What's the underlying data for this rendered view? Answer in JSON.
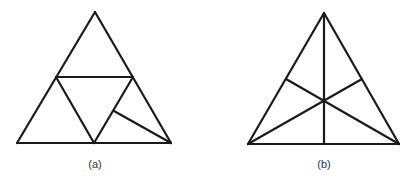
{
  "colors": {
    "stroke": "#1a1a1a",
    "label": "#333333",
    "background": "#ffffff"
  },
  "figures": [
    {
      "label": "(a)",
      "label_pos": [
        95,
        158
      ],
      "description": "Triangle subdivided into four triangles by midpoints, with an extra segment from an interior point to the bottom-right vertex",
      "segments": [
        [
          95,
          12,
          17,
          143
        ],
        [
          95,
          12,
          171,
          143
        ],
        [
          17,
          143,
          171,
          143
        ],
        [
          56,
          77,
          133,
          77
        ],
        [
          56,
          77,
          94,
          143
        ],
        [
          133,
          77,
          94,
          143
        ],
        [
          114,
          111,
          171,
          143
        ]
      ]
    },
    {
      "label": "(b)",
      "label_pos": [
        324,
        158
      ],
      "description": "Triangle with its three medians meeting at the centroid",
      "segments": [
        [
          324,
          13,
          248,
          144
        ],
        [
          324,
          13,
          399,
          144
        ],
        [
          248,
          144,
          399,
          144
        ],
        [
          324,
          13,
          324,
          144
        ],
        [
          248,
          144,
          362,
          79
        ],
        [
          399,
          144,
          286,
          79
        ]
      ]
    }
  ]
}
